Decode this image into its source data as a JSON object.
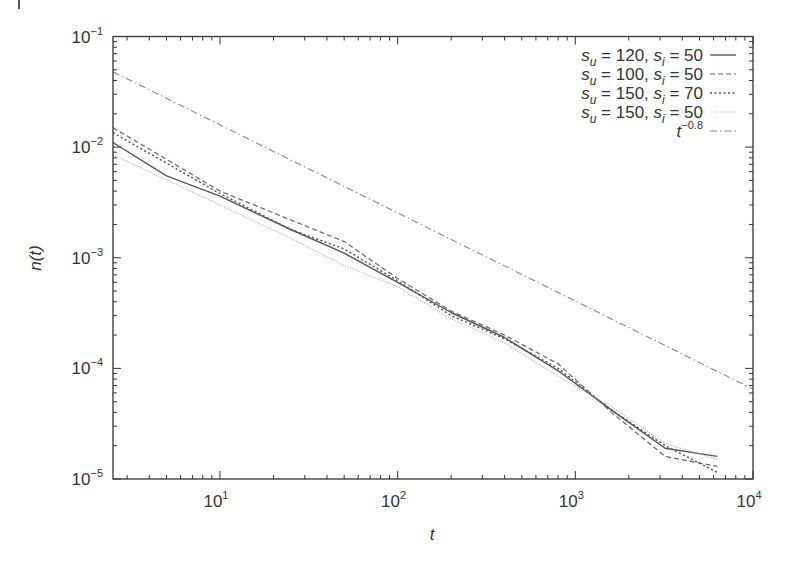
{
  "chart_data": {
    "type": "line",
    "title": "",
    "xlabel": "t",
    "ylabel": "n(t)",
    "xscale": "log",
    "yscale": "log",
    "xlim": [
      2.5,
      10000
    ],
    "ylim": [
      1e-05,
      0.1
    ],
    "x_ticks": [
      {
        "value": 10,
        "label": "10",
        "exp": "1"
      },
      {
        "value": 100,
        "label": "10",
        "exp": "2"
      },
      {
        "value": 1000,
        "label": "10",
        "exp": "3"
      },
      {
        "value": 10000,
        "label": "10",
        "exp": "4"
      }
    ],
    "y_ticks": [
      {
        "value": 0.1,
        "label": "10",
        "exp": "−1"
      },
      {
        "value": 0.01,
        "label": "10",
        "exp": "−2"
      },
      {
        "value": 0.001,
        "label": "10",
        "exp": "−3"
      },
      {
        "value": 0.0001,
        "label": "10",
        "exp": "−4"
      },
      {
        "value": 1e-05,
        "label": "10",
        "exp": "−5"
      }
    ],
    "grid": false,
    "legend_position": "upper right",
    "series": [
      {
        "name": "s_u = 120, s_i = 50",
        "legend": {
          "a": "s",
          "a_sub": "u",
          "a_val": " = 120, ",
          "b": "s",
          "b_sub": "i",
          "b_val": " = 50"
        },
        "style": "solid",
        "color": "#555555",
        "x": [
          2.5,
          5,
          10,
          25,
          50,
          100,
          200,
          400,
          800,
          1600,
          3200,
          6300
        ],
        "values": [
          0.011,
          0.0055,
          0.0036,
          0.0018,
          0.0011,
          0.0006,
          0.00032,
          0.00019,
          9.5e-05,
          4.2e-05,
          1.9e-05,
          1.6e-05
        ]
      },
      {
        "name": "s_u = 100, s_i = 50",
        "legend": {
          "a": "s",
          "a_sub": "u",
          "a_val": " = 100, ",
          "b": "s",
          "b_sub": "i",
          "b_val": " = 50"
        },
        "style": "dashed",
        "color": "#666666",
        "x": [
          2.5,
          10,
          25,
          50,
          100,
          200,
          400,
          800,
          1600,
          3200,
          6300
        ],
        "values": [
          0.015,
          0.004,
          0.0022,
          0.0014,
          0.00065,
          0.00033,
          0.0002,
          0.00011,
          4e-05,
          1.6e-05,
          1.3e-05
        ]
      },
      {
        "name": "s_u = 150, s_i = 70",
        "legend": {
          "a": "s",
          "a_sub": "u",
          "a_val": " = 150, ",
          "b": "s",
          "b_sub": "i",
          "b_val": " = 70"
        },
        "style": "dotted",
        "color": "#555555",
        "x": [
          2.5,
          10,
          25,
          50,
          100,
          200,
          400,
          800,
          1600,
          3200,
          6300
        ],
        "values": [
          0.0135,
          0.0038,
          0.0018,
          0.0012,
          0.00062,
          0.0003,
          0.000185,
          0.0001,
          4.2e-05,
          2e-05,
          1.15e-05
        ]
      },
      {
        "name": "s_u = 150, s_i = 50",
        "legend": {
          "a": "s",
          "a_sub": "u",
          "a_val": " = 150, ",
          "b": "s",
          "b_sub": "i",
          "b_val": " = 50"
        },
        "style": "fine-dotted",
        "color": "#aaaaaa",
        "x": [
          2.5,
          10,
          25,
          50,
          100,
          200,
          400,
          800,
          1600,
          3200,
          6300
        ],
        "values": [
          0.0085,
          0.003,
          0.0015,
          0.00085,
          0.00055,
          0.00028,
          0.00017,
          8.5e-05,
          4.5e-05,
          2.1e-05,
          1.5e-05
        ]
      },
      {
        "name": "t^-0.8",
        "legend": {
          "a": "t",
          "exp": "−0.8"
        },
        "style": "dash-dot",
        "color": "#888888",
        "x": [
          2.5,
          10000
        ],
        "values": [
          0.048,
          6.5e-05
        ]
      }
    ]
  }
}
